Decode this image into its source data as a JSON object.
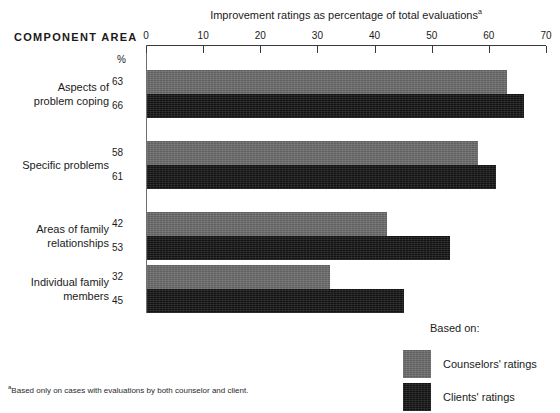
{
  "header": {
    "component_area_label": "COMPONENT AREA",
    "percent_symbol": "%"
  },
  "footnote": {
    "marker": "a",
    "text": "Based only on cases with evaluations by both counselor and client."
  },
  "legend": {
    "title": "Based on:",
    "items": [
      {
        "label": "Counselors' ratings",
        "swatch": "light-gray-swatch",
        "color": "#6d6d6d"
      },
      {
        "label": "Clients' ratings",
        "swatch": "dark-swatch",
        "color": "#1f1f1f"
      }
    ]
  },
  "chart_data": {
    "type": "bar",
    "orientation": "horizontal",
    "title": "Improvement ratings as percentage of total evaluations",
    "title_footnote_marker": "a",
    "xlabel": "",
    "ylabel": "COMPONENT AREA",
    "xlim": [
      0,
      70
    ],
    "xticks": [
      0,
      10,
      20,
      30,
      40,
      50,
      60,
      70
    ],
    "xtick_labels": [
      "0",
      "10",
      "20",
      "30",
      "40",
      "50",
      "60",
      "70"
    ],
    "unit": "%",
    "grid": false,
    "legend_position": "bottom-right",
    "categories": [
      "Aspects of problem coping",
      "Specific problems",
      "Areas of family relationships",
      "Individual family members"
    ],
    "category_lines": [
      [
        "Aspects of",
        "problem coping"
      ],
      [
        "Specific problems"
      ],
      [
        "Areas of family",
        "relationships"
      ],
      [
        "Individual family",
        "members"
      ]
    ],
    "series": [
      {
        "name": "Counselors' ratings",
        "color": "#6d6d6d",
        "values": [
          63,
          58,
          42,
          32
        ]
      },
      {
        "name": "Clients' ratings",
        "color": "#1f1f1f",
        "values": [
          66,
          61,
          53,
          45
        ]
      }
    ]
  }
}
